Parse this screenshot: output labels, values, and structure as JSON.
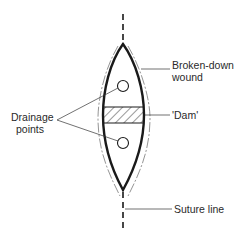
{
  "diagram": {
    "type": "anatomical-schematic",
    "labels": {
      "broken_down_line1": "Broken-down",
      "broken_down_line2": "wound",
      "dam": "'Dam'",
      "drainage_line1": "Drainage",
      "drainage_line2": "points",
      "suture": "Suture line"
    },
    "colors": {
      "stroke": "#1a1a1a",
      "thin": "#555555",
      "background": "#ffffff"
    }
  }
}
